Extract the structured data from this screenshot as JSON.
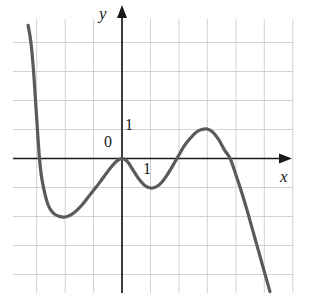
{
  "figure": {
    "title": "",
    "background_color": "#ffffff"
  },
  "labels": {
    "y_axis": "y",
    "x_axis": "x",
    "origin": "0",
    "unit_y": "1",
    "unit_x": "1"
  },
  "style": {
    "curve_color": "#5a5a5a",
    "axis_color": "#1a1a1a",
    "grid_color": "#c9cdd4",
    "text_color": "#1a1a1a",
    "curve_width": 3.2,
    "axis_width": 1.6,
    "grid_width": 0.9
  },
  "chart_data": {
    "type": "line",
    "title": "",
    "xlabel": "x",
    "ylabel": "y",
    "grid": true,
    "legend": null,
    "axis_origin_label": "0",
    "x_unit_tick_label": "1",
    "y_unit_tick_label": "1",
    "xlim": [
      -3.7,
      5.9
    ],
    "ylim": [
      -4.7,
      4.6
    ],
    "x_tick_spacing": 1,
    "y_tick_spacing": 1,
    "key_points": [
      {
        "name": "left-branch-start",
        "x": -3.3,
        "y": 4.6
      },
      {
        "name": "left-x-intercept",
        "x": -2.9,
        "y": 0
      },
      {
        "name": "local-minimum-left",
        "x": -2.0,
        "y": -2.0
      },
      {
        "name": "origin-tangency",
        "x": 0,
        "y": 0
      },
      {
        "name": "local-minimum-right",
        "x": 1.0,
        "y": -1.0
      },
      {
        "name": "local-maximum",
        "x": 3.0,
        "y": 1.0
      },
      {
        "name": "right-x-intercept",
        "x": 3.8,
        "y": 0
      },
      {
        "name": "right-branch-end",
        "x": 5.2,
        "y": -4.6
      }
    ],
    "points": [
      {
        "x": -3.3,
        "y": 4.6
      },
      {
        "x": -3.2,
        "y": 4.0
      },
      {
        "x": -3.1,
        "y": 2.9
      },
      {
        "x": -3.0,
        "y": 1.4
      },
      {
        "x": -2.9,
        "y": 0.0
      },
      {
        "x": -2.8,
        "y": -0.8
      },
      {
        "x": -2.6,
        "y": -1.6
      },
      {
        "x": -2.4,
        "y": -1.9
      },
      {
        "x": -2.2,
        "y": -2.0
      },
      {
        "x": -2.0,
        "y": -2.02
      },
      {
        "x": -1.8,
        "y": -1.95
      },
      {
        "x": -1.6,
        "y": -1.8
      },
      {
        "x": -1.4,
        "y": -1.6
      },
      {
        "x": -1.2,
        "y": -1.35
      },
      {
        "x": -1.0,
        "y": -1.1
      },
      {
        "x": -0.8,
        "y": -0.85
      },
      {
        "x": -0.6,
        "y": -0.58
      },
      {
        "x": -0.4,
        "y": -0.32
      },
      {
        "x": -0.2,
        "y": -0.1
      },
      {
        "x": 0.0,
        "y": 0.0
      },
      {
        "x": 0.2,
        "y": -0.12
      },
      {
        "x": 0.4,
        "y": -0.42
      },
      {
        "x": 0.6,
        "y": -0.72
      },
      {
        "x": 0.8,
        "y": -0.93
      },
      {
        "x": 1.0,
        "y": -1.02
      },
      {
        "x": 1.2,
        "y": -0.98
      },
      {
        "x": 1.4,
        "y": -0.82
      },
      {
        "x": 1.6,
        "y": -0.55
      },
      {
        "x": 1.8,
        "y": -0.22
      },
      {
        "x": 2.0,
        "y": 0.12
      },
      {
        "x": 2.2,
        "y": 0.45
      },
      {
        "x": 2.4,
        "y": 0.7
      },
      {
        "x": 2.6,
        "y": 0.9
      },
      {
        "x": 2.8,
        "y": 1.0
      },
      {
        "x": 3.0,
        "y": 1.02
      },
      {
        "x": 3.2,
        "y": 0.9
      },
      {
        "x": 3.4,
        "y": 0.65
      },
      {
        "x": 3.6,
        "y": 0.3
      },
      {
        "x": 3.8,
        "y": 0.0
      },
      {
        "x": 4.0,
        "y": -0.55
      },
      {
        "x": 4.2,
        "y": -1.15
      },
      {
        "x": 4.4,
        "y": -1.8
      },
      {
        "x": 4.6,
        "y": -2.5
      },
      {
        "x": 4.8,
        "y": -3.2
      },
      {
        "x": 5.0,
        "y": -3.9
      },
      {
        "x": 5.2,
        "y": -4.6
      }
    ]
  }
}
